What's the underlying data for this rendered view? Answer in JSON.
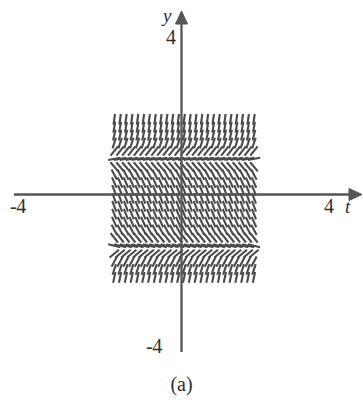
{
  "figure": {
    "caption": "(a)",
    "background_color": "#ffffff",
    "ink_color": "#4a4a4a",
    "axis_color": "#555555"
  },
  "axes": {
    "horizontal": {
      "name": "t",
      "tick_left": "-4",
      "tick_right": "4",
      "arrow": "arrow-right"
    },
    "vertical": {
      "name": "y",
      "tick_top": "4",
      "tick_bottom": "-4",
      "arrow": "arrow-up"
    }
  },
  "chart_data": {
    "type": "scatter",
    "subtype": "slope-field",
    "title": "",
    "xlabel": "t",
    "ylabel": "y",
    "xlim": [
      -4.9,
      5.1
    ],
    "ylim": [
      -5.0,
      4.6
    ],
    "xticks": [
      -4,
      4
    ],
    "xticklabels": [
      "-4",
      "4"
    ],
    "yticks": [
      -4,
      4
    ],
    "yticklabels": [
      "-4",
      "4"
    ],
    "grid": false,
    "legend": null,
    "annotations": [
      "(a)"
    ],
    "equilibria_y": [
      2.6,
      -3.1
    ],
    "t_samples": [
      -4.62,
      -4.22,
      -3.82,
      -3.42,
      -3.02,
      -2.62,
      -2.22,
      -1.82,
      -1.42,
      -1.02,
      -0.62,
      -0.22,
      0.18,
      0.58,
      0.98,
      1.38,
      1.78,
      2.18,
      2.58,
      2.98,
      3.38,
      3.78,
      4.18,
      4.58,
      4.98
    ],
    "y_samples": [
      4.28,
      3.83,
      3.38,
      2.93,
      2.48,
      2.03,
      1.58,
      1.13,
      0.68,
      0.23,
      -0.22,
      -0.67,
      -1.12,
      -1.57,
      -2.02,
      -2.47,
      -2.92,
      -3.37,
      -3.82,
      -4.27,
      -4.72
    ],
    "row_slope_angles_deg": [
      82,
      80,
      77,
      72,
      52,
      10,
      -50,
      -62,
      -66,
      -68,
      -69,
      -69,
      -68,
      -66,
      -62,
      -52,
      -14,
      40,
      62,
      72,
      78
    ],
    "slope_sign_by_row": [
      "+",
      "+",
      "+",
      "+",
      "+",
      "+",
      "-",
      "-",
      "-",
      "-",
      "-",
      "-",
      "-",
      "-",
      "-",
      "-",
      "-",
      "+",
      "+",
      "+",
      "+"
    ]
  }
}
